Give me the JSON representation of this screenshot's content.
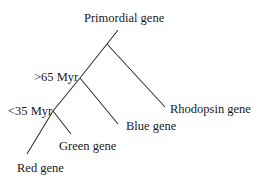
{
  "diagram": {
    "type": "phylogenetic-tree",
    "root_label": "Primordial gene",
    "nodes": [
      {
        "id": "root",
        "label": "Primordial gene"
      },
      {
        "id": "split1",
        "label": ""
      },
      {
        "id": "split2",
        "label": ">65 Myr"
      },
      {
        "id": "split3",
        "label": "<35 Myr"
      }
    ],
    "leaves": [
      {
        "id": "rhodopsin",
        "label": "Rhodopsin gene"
      },
      {
        "id": "blue",
        "label": "Blue gene"
      },
      {
        "id": "green",
        "label": "Green gene"
      },
      {
        "id": "red",
        "label": "Red gene"
      }
    ],
    "edges": [
      [
        "root",
        "split1"
      ],
      [
        "split1",
        "rhodopsin"
      ],
      [
        "split1",
        "split2"
      ],
      [
        "split2",
        "blue"
      ],
      [
        "split2",
        "split3"
      ],
      [
        "split3",
        "green"
      ],
      [
        "split3",
        "red"
      ]
    ],
    "line_color": "#333333"
  }
}
